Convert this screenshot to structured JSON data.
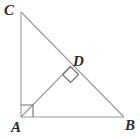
{
  "figure": {
    "background_color": "#ffffff",
    "stroke_color": "#9a9a9a",
    "label_color": "#2b2b2b",
    "stroke_width": 1,
    "labels": {
      "C": "C",
      "D": "D",
      "A": "A",
      "B": "B"
    },
    "vertices": {
      "C": {
        "x": 21,
        "y": 12
      },
      "A": {
        "x": 21,
        "y": 117
      },
      "B": {
        "x": 124,
        "y": 117
      },
      "D": {
        "x": 70,
        "y": 66
      }
    },
    "segments": [
      {
        "name": "leg-CA",
        "from": "C",
        "to": "A"
      },
      {
        "name": "leg-AB",
        "from": "A",
        "to": "B"
      },
      {
        "name": "hypotenuse-CB",
        "from": "C",
        "to": "B"
      },
      {
        "name": "altitude-AD",
        "from": "A",
        "to": "D"
      }
    ],
    "right_angle_marks": [
      {
        "name": "right-angle-at-A",
        "vertex": "A",
        "size": 12
      },
      {
        "name": "right-angle-at-D",
        "vertex": "D",
        "size": 11
      }
    ]
  }
}
